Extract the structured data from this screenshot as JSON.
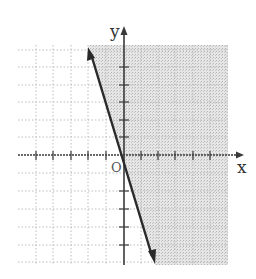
{
  "figure": {
    "type": "linear-inequality-graph",
    "x_axis_label": "x",
    "y_axis_label": "y",
    "origin_label": "O",
    "grid": {
      "x_min": -6,
      "x_max": 6,
      "y_min": -6,
      "y_max": 6,
      "spacing_units": 1,
      "style": "dotted"
    },
    "boundary_line": {
      "slope": -3,
      "intercept": 0,
      "style": "solid",
      "arrows": "both"
    },
    "shaded_region": "right of line",
    "colors": {
      "line": "#2a2a2a",
      "axes": "#3a3a3a",
      "grid": "#bdbdbd",
      "shade": "#d9d9d9"
    }
  }
}
